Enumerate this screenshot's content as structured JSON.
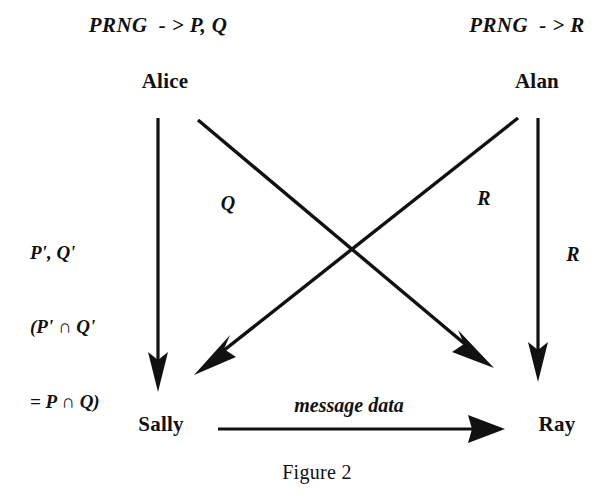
{
  "figure": {
    "caption": "Figure 2",
    "background_color": "#ffffff",
    "ink_color": "#111111"
  },
  "headers": {
    "left": "PRNG  - > P, Q",
    "right": "PRNG  - > R"
  },
  "nodes": {
    "top_left": "Alice",
    "top_right": "Alan",
    "bottom_left": "Sally",
    "bottom_right": "Ray"
  },
  "annotations": {
    "left_block": {
      "line1": "P', Q'",
      "line2": "(P' ∩ Q'",
      "line3": "= P ∩ Q)"
    },
    "diagonal_alice_to_ray": "Q",
    "diagonal_alan_to_sally": "R",
    "vertical_alan_to_ray": "R",
    "message": "message data"
  },
  "edges": [
    {
      "name": "alice-to-sally",
      "from": "Alice",
      "to": "Sally",
      "label": "P', Q' (P' ∩ Q' = P ∩ Q)",
      "style": "vertical-arrow"
    },
    {
      "name": "alice-to-ray",
      "from": "Alice",
      "to": "Ray",
      "label": "Q",
      "style": "diagonal-arrow"
    },
    {
      "name": "alan-to-sally",
      "from": "Alan",
      "to": "Sally",
      "label": "R",
      "style": "diagonal-arrow"
    },
    {
      "name": "alan-to-ray",
      "from": "Alan",
      "to": "Ray",
      "label": "R",
      "style": "vertical-arrow"
    },
    {
      "name": "sally-to-ray",
      "from": "Sally",
      "to": "Ray",
      "label": "message data",
      "style": "horizontal-arrow"
    }
  ]
}
